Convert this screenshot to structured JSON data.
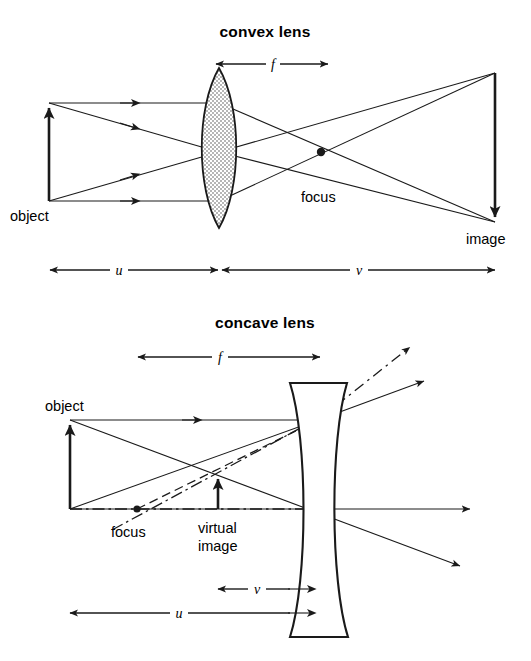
{
  "figure": {
    "kind": "optics-ray-diagram",
    "background_color": "#ffffff",
    "ink_color": "#1a1a1a",
    "panels": [
      {
        "id": "convex",
        "title": "convex lens",
        "lens_type": "biconvex",
        "lens_fill": "stippled",
        "labels": {
          "object": "object",
          "image": "image",
          "focus": "focus",
          "focal_length": "f",
          "object_distance": "u",
          "image_distance": "v"
        },
        "geometry": {
          "axis_y": 152,
          "lens_center_x": 219,
          "lens_top_y": 68,
          "lens_bottom_y": 228,
          "lens_half_width": 22,
          "object_x": 49,
          "object_top_y": 103,
          "object_base_y": 201,
          "image_x": 495,
          "image_top_y": 73,
          "image_base_y": 222,
          "focus_x": 321,
          "focus_y": 152,
          "f_line_y": 64,
          "f_x1": 216,
          "f_x2": 328,
          "uv_line_y": 270,
          "u_x1": 50,
          "u_x2": 218,
          "v_x1": 222,
          "v_x2": 495
        }
      },
      {
        "id": "concave",
        "title": "concave lens",
        "lens_type": "biconcave",
        "lens_fill": "none",
        "labels": {
          "object": "object",
          "focus": "focus",
          "virtual_image_line1": "virtual",
          "virtual_image_line2": "image",
          "focal_length": "f",
          "object_distance": "u",
          "image_distance": "v"
        },
        "geometry": {
          "axis_y": 509,
          "lens_center_x": 318,
          "lens_top_y": 383,
          "lens_bottom_y": 637,
          "lens_outer_left_x": 290,
          "lens_outer_right_x": 347,
          "lens_waist_left_x": 307,
          "lens_waist_right_x": 328,
          "object_x": 70,
          "object_top_y": 420,
          "object_base_y": 509,
          "virtual_image_x": 218,
          "virtual_image_top_y": 474,
          "virtual_image_base_y": 509,
          "focus_x": 137,
          "focus_y": 509,
          "f_line_y": 357,
          "f_x1": 138,
          "f_x2": 320,
          "v_line_y": 585,
          "v_x1": 218,
          "v_x2": 318,
          "u_line_y": 610,
          "u_x1": 70,
          "u_x2": 318
        }
      }
    ]
  },
  "text": {
    "convex_title": "convex lens",
    "convex_object": "object",
    "convex_image": "image",
    "convex_focus": "focus",
    "convex_f": "f",
    "convex_u": "u",
    "convex_v": "v",
    "concave_title": "concave lens",
    "concave_object": "object",
    "concave_focus": "focus",
    "concave_virtual": "virtual",
    "concave_image": "image",
    "concave_f": "f",
    "concave_u": "u",
    "concave_v": "v"
  }
}
